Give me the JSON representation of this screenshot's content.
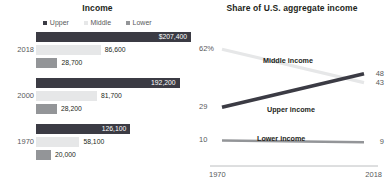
{
  "colors": {
    "upper": "#3b3b44",
    "middle": "#e6e7e8",
    "lower": "#939598",
    "text": "#231f20",
    "muted": "#58595b",
    "axis": "#bcbec0",
    "white": "#ffffff"
  },
  "left": {
    "title": "Income",
    "legend": [
      {
        "label": "Upper",
        "key": "upper"
      },
      {
        "label": "Middle",
        "key": "middle"
      },
      {
        "label": "Lower",
        "key": "lower"
      }
    ],
    "groups": [
      {
        "year": "2018",
        "bars": [
          {
            "series": "Upper",
            "key": "upper",
            "label": "$207,400",
            "value": 207400,
            "inside": true
          },
          {
            "series": "Middle",
            "key": "middle",
            "label": "86,600",
            "value": 86600,
            "inside": false
          },
          {
            "series": "Lower",
            "key": "lower",
            "label": "28,700",
            "value": 28700,
            "inside": false
          }
        ]
      },
      {
        "year": "2000",
        "bars": [
          {
            "series": "Upper",
            "key": "upper",
            "label": "192,200",
            "value": 192200,
            "inside": true
          },
          {
            "series": "Middle",
            "key": "middle",
            "label": "81,700",
            "value": 81700,
            "inside": false
          },
          {
            "series": "Lower",
            "key": "lower",
            "label": "28,200",
            "value": 28200,
            "inside": false
          }
        ]
      },
      {
        "year": "1970",
        "bars": [
          {
            "series": "Upper",
            "key": "upper",
            "label": "126,100",
            "value": 126100,
            "inside": true
          },
          {
            "series": "Middle",
            "key": "middle",
            "label": "58,100",
            "value": 58100,
            "inside": false
          },
          {
            "series": "Lower",
            "key": "lower",
            "label": "20,000",
            "value": 20000,
            "inside": false
          }
        ]
      }
    ]
  },
  "right": {
    "title": "Share of U.S. aggregate income",
    "x_start_label": "1970",
    "x_end_label": "2018",
    "series": [
      {
        "name": "Middle income",
        "key": "middle",
        "start_label": "62%",
        "end_label": "43",
        "start_value": 62,
        "end_value": 43
      },
      {
        "name": "Upper income",
        "key": "upper",
        "start_label": "29",
        "end_label": "48",
        "start_value": 29,
        "end_value": 48
      },
      {
        "name": "Lower income",
        "key": "lower",
        "start_label": "10",
        "end_label": "9",
        "start_value": 10,
        "end_value": 9
      }
    ]
  },
  "chart_data": [
    {
      "type": "bar",
      "title": "Income",
      "xlabel": "",
      "ylabel": "",
      "orientation": "horizontal",
      "grid": false,
      "legend_position": "top-center",
      "categories": [
        "2018",
        "2000",
        "1970"
      ],
      "series": [
        {
          "name": "Upper",
          "values": [
            207400,
            192200,
            126100
          ]
        },
        {
          "name": "Middle",
          "values": [
            86600,
            81700,
            58100
          ]
        },
        {
          "name": "Lower",
          "values": [
            28700,
            28200,
            20000
          ]
        }
      ],
      "data_labels": [
        [
          "$207,400",
          "86,600",
          "28,700"
        ],
        [
          "192,200",
          "81,700",
          "28,200"
        ],
        [
          "126,100",
          "58,100",
          "20,000"
        ]
      ],
      "xlim": [
        0,
        207400
      ]
    },
    {
      "type": "line",
      "title": "Share of U.S. aggregate income",
      "xlabel": "",
      "ylabel": "",
      "grid": false,
      "legend_position": "inline-labels",
      "x": [
        1970,
        2018
      ],
      "xtick_labels": [
        "1970",
        "2018"
      ],
      "ylim": [
        0,
        65
      ],
      "series": [
        {
          "name": "Middle income",
          "values": [
            62,
            43
          ],
          "endpoint_labels": [
            "62%",
            "43"
          ]
        },
        {
          "name": "Upper income",
          "values": [
            29,
            48
          ],
          "endpoint_labels": [
            "29",
            "48"
          ]
        },
        {
          "name": "Lower income",
          "values": [
            10,
            9
          ],
          "endpoint_labels": [
            "10",
            "9"
          ]
        }
      ]
    }
  ]
}
